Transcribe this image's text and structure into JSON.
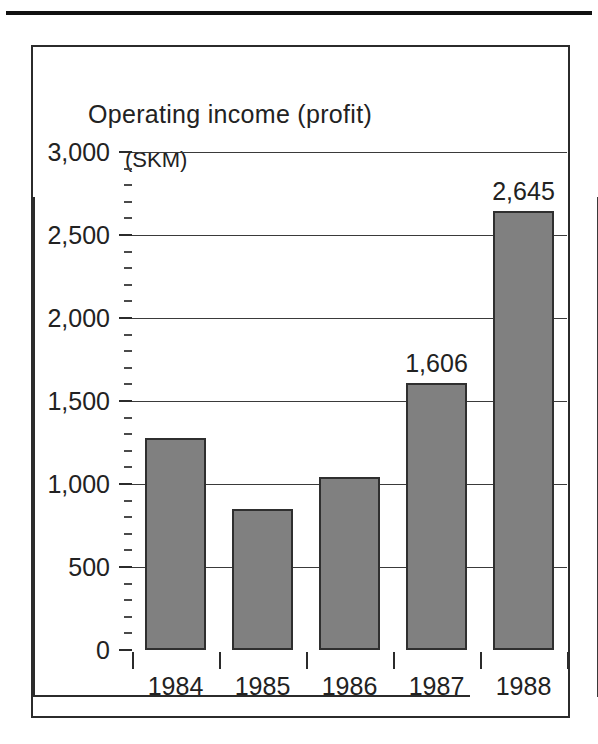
{
  "figure": {
    "title": "Operating income (profit)",
    "unit_label": "(SKM)"
  },
  "chart_data": {
    "type": "bar",
    "title": "Operating income (profit)",
    "subtitle": "",
    "xlabel": "",
    "ylabel": "(SKM)",
    "categories": [
      "1984",
      "1985",
      "1986",
      "1987",
      "1988"
    ],
    "values": [
      1280,
      850,
      1045,
      1606,
      2645
    ],
    "data_labels": [
      "",
      "",
      "",
      "1,606",
      "2,645"
    ],
    "ylim": [
      0,
      3000
    ],
    "ytick_labels": [
      "0",
      "500",
      "1,000",
      "1,500",
      "2,000",
      "2,500",
      "3,000"
    ],
    "ytick_values": [
      0,
      500,
      1000,
      1500,
      2000,
      2500,
      3000
    ],
    "minor_tick_interval": 100,
    "grid": true,
    "legend": "none",
    "bar_color": "#808080",
    "bar_edge_color": "#2f2f2f",
    "axis_color": "#2b2b2b"
  }
}
